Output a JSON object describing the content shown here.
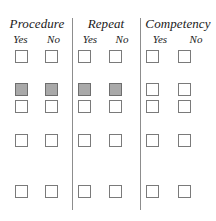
{
  "form": {
    "title": "Procedure / Repeat / Competency checklist grid",
    "groups": [
      {
        "id": "procedure",
        "title": "Procedure",
        "columns": [
          {
            "id": "yes",
            "label": "Yes"
          },
          {
            "id": "no",
            "label": "No"
          }
        ]
      },
      {
        "id": "repeat",
        "title": "Repeat",
        "columns": [
          {
            "id": "yes",
            "label": "Yes"
          },
          {
            "id": "no",
            "label": "No"
          }
        ]
      },
      {
        "id": "competency",
        "title": "Competency",
        "columns": [
          {
            "id": "yes",
            "label": "Yes"
          },
          {
            "id": "no",
            "label": "No"
          }
        ]
      }
    ],
    "row_count": 5,
    "checkbox_columns_x": [
      15,
      45,
      78,
      109,
      146,
      178
    ],
    "checkbox_rows_y": [
      50,
      83,
      100,
      134,
      185
    ],
    "checkbox_size": 13,
    "checked_cells": [
      {
        "row": 1,
        "col": 0
      },
      {
        "row": 1,
        "col": 1
      },
      {
        "row": 1,
        "col": 2
      },
      {
        "row": 1,
        "col": 3
      }
    ],
    "dividers_x": [
      72,
      140
    ],
    "colors": {
      "page_background": "#ffffff",
      "checkbox_border": "#7a7a7a",
      "checkbox_unchecked_fill": "#ffffff",
      "checkbox_checked_fill": "#a9a9a9",
      "divider": "#8d8d8d",
      "text": "#1a1a1a"
    }
  }
}
